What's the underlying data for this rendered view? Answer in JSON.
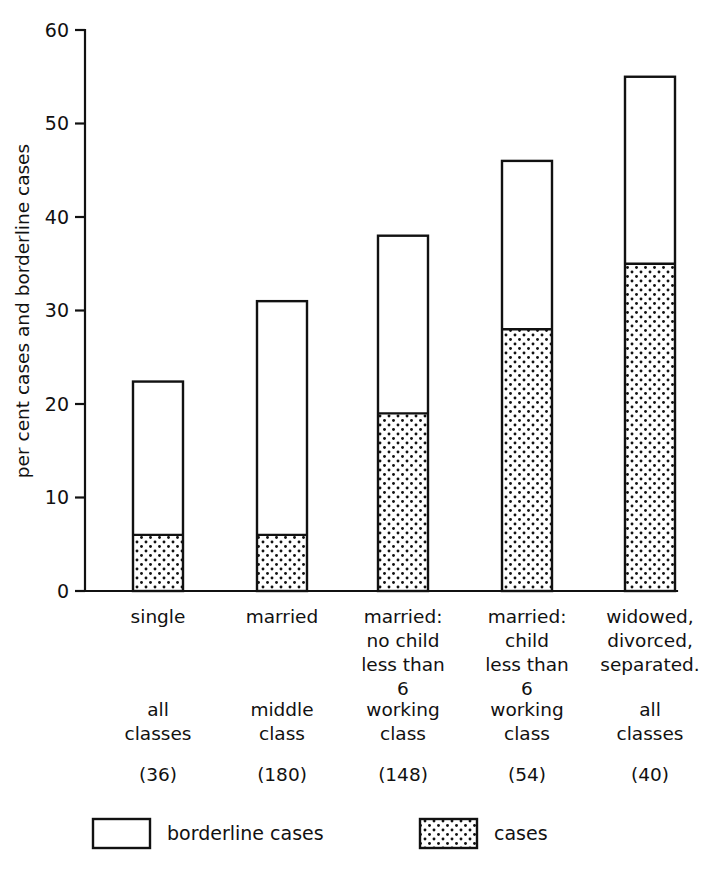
{
  "chart_data": {
    "type": "bar",
    "stacked": true,
    "title": "",
    "xlabel": "",
    "ylabel": "per cent cases and borderline cases",
    "ylim": [
      0,
      60
    ],
    "yticks": [
      0,
      10,
      20,
      30,
      40,
      50,
      60
    ],
    "ytick_labels": [
      "0",
      "10",
      "20",
      "30",
      "40",
      "50",
      "60"
    ],
    "grid": false,
    "legend_position": "bottom",
    "categories": [
      "single",
      "married",
      "married: no child less than 6",
      "married: child less than 6",
      "widowed, divorced, separated."
    ],
    "category_lines": [
      [
        "single"
      ],
      [
        "married"
      ],
      [
        "married:",
        "no child",
        "less than",
        "6"
      ],
      [
        "married:",
        "child",
        "less than",
        "6"
      ],
      [
        "widowed,",
        "divorced,",
        "separated."
      ]
    ],
    "sub_labels": [
      [
        "all",
        "classes"
      ],
      [
        "middle",
        "class"
      ],
      [
        "working",
        "class"
      ],
      [
        "working",
        "class"
      ],
      [
        "all",
        "classes"
      ]
    ],
    "counts": [
      "(36)",
      "(180)",
      "(148)",
      "(54)",
      "(40)"
    ],
    "series": [
      {
        "name": "cases",
        "values": [
          6,
          6,
          19,
          28,
          35
        ]
      },
      {
        "name": "borderline cases",
        "values": [
          16.4,
          25,
          19,
          18,
          20
        ]
      }
    ],
    "totals": [
      22.4,
      31,
      38,
      46,
      55
    ],
    "legend": [
      {
        "label": "borderline cases",
        "fill": "white"
      },
      {
        "label": "cases",
        "fill": "dotted"
      }
    ],
    "colors": {
      "stroke": "#111111",
      "borderline": "#ffffff",
      "cases_dots": "#111111"
    }
  }
}
